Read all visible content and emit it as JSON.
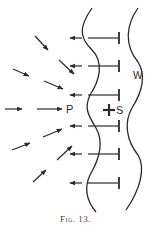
{
  "figure": {
    "caption": "Fig. 13.",
    "labels": {
      "point_p": "P",
      "source_s": "S",
      "wall_w": "W",
      "marker": "I"
    },
    "colors": {
      "ink": "#2a2a2a",
      "background": "#ffffff"
    }
  }
}
